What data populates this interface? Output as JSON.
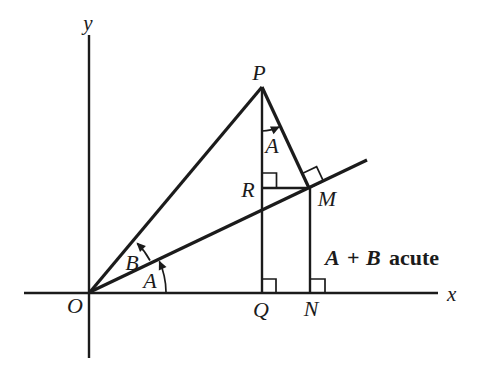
{
  "figure": {
    "colors": {
      "ink": "#1b1b1b",
      "background": "#ffffff"
    },
    "axes": {
      "x_label": "x",
      "y_label": "y"
    },
    "points": {
      "O": "O",
      "P": "P",
      "Q": "Q",
      "R": "R",
      "M": "M",
      "N": "N"
    },
    "angles": {
      "A_at_origin": "A",
      "B_at_origin": "B",
      "A_at_P": "A"
    },
    "annotation": {
      "A": "A",
      "plus": "+",
      "B": "B",
      "suffix": "acute"
    }
  }
}
